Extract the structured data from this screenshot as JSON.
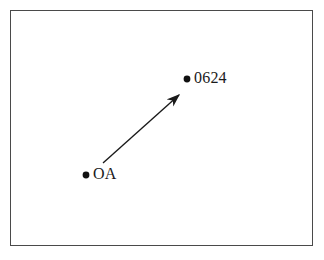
{
  "figure": {
    "title": "",
    "background_color": "#ffffff",
    "border_color": "#4a4a4a"
  },
  "nodes": [
    {
      "id": "source",
      "label": "OA",
      "dot_x": 86,
      "dot_y": 175,
      "label_x": 93,
      "label_y": 166,
      "color": "#1a1a1a"
    },
    {
      "id": "target",
      "label": "0624",
      "dot_x": 187,
      "dot_y": 79,
      "label_x": 194,
      "label_y": 70,
      "color": "#1a1a1a"
    }
  ],
  "arrow": {
    "from_x": 103,
    "from_y": 163,
    "to_x": 179,
    "to_y": 95,
    "color": "#1a1a1a",
    "stroke_width": 1.4
  }
}
